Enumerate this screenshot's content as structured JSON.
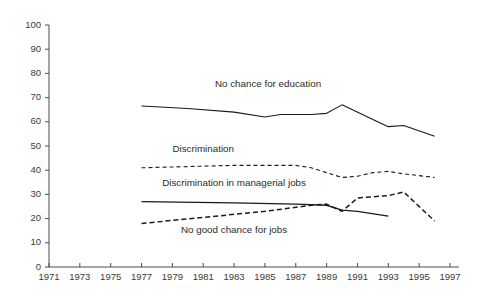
{
  "chart_data": {
    "type": "line",
    "title": "",
    "subtitle": "",
    "xlabel": "",
    "ylabel": "",
    "xlim": [
      1971,
      1997
    ],
    "ylim": [
      0,
      100
    ],
    "grid": false,
    "legend_position": "inline-labels",
    "x_ticks": [
      1971,
      1973,
      1975,
      1977,
      1979,
      1981,
      1983,
      1985,
      1987,
      1989,
      1991,
      1993,
      1995,
      1997
    ],
    "y_ticks": [
      0,
      10,
      20,
      30,
      40,
      50,
      60,
      70,
      80,
      90,
      100
    ],
    "series": [
      {
        "name": "No chance for education",
        "style": "solid",
        "color": "#1a1a1a",
        "width": 1.1,
        "label_x": 1985.2,
        "label_y": 74.5,
        "x": [
          1977,
          1980,
          1983,
          1985,
          1986,
          1987,
          1988,
          1989,
          1990,
          1992,
          1993,
          1994,
          1996
        ],
        "y": [
          66.5,
          65.5,
          64.0,
          62.0,
          63.0,
          63.0,
          63.0,
          63.5,
          67.0,
          61.0,
          58.0,
          58.5,
          54.0
        ]
      },
      {
        "name": "Discrimination",
        "style": "dashed",
        "color": "#1a1a1a",
        "width": 1.1,
        "label_x": 1981.0,
        "label_y": 47.5,
        "x": [
          1977,
          1980,
          1983,
          1985,
          1987,
          1988,
          1989,
          1990,
          1991,
          1992,
          1993,
          1994,
          1996
        ],
        "y": [
          41.0,
          41.5,
          42.0,
          42.0,
          42.0,
          41.0,
          39.0,
          37.0,
          37.5,
          39.0,
          39.5,
          38.5,
          37.0
        ]
      },
      {
        "name": "Discrimination in managerial jobs",
        "style": "solid",
        "color": "#1a1a1a",
        "width": 1.4,
        "label_x": 1983.0,
        "label_y": 33.5,
        "x": [
          1977,
          1983,
          1987,
          1989,
          1990,
          1991,
          1993
        ],
        "y": [
          27.0,
          26.5,
          26.0,
          25.5,
          23.5,
          23.0,
          21.0
        ]
      },
      {
        "name": "No good chance for jobs",
        "style": "dashed",
        "color": "#1a1a1a",
        "width": 1.5,
        "label_x": 1983.0,
        "label_y": 14.0,
        "x": [
          1977,
          1981,
          1985,
          1988,
          1989,
          1990,
          1991,
          1992,
          1993,
          1994,
          1996
        ],
        "y": [
          18.0,
          20.5,
          23.0,
          25.5,
          26.0,
          23.0,
          28.5,
          29.0,
          29.5,
          31.0,
          19.0
        ]
      }
    ]
  }
}
